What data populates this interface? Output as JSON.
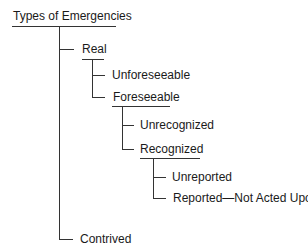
{
  "diagram": {
    "title": "Types of Emergencies",
    "nodes": {
      "real": "Real",
      "unforeseeable": "Unforeseeable",
      "foreseeable": "Foreseeable",
      "unrecognized": "Unrecognized",
      "recognized": "Recognized",
      "unreported": "Unreported",
      "reported_not_acted": "Reported—Not Acted Upon",
      "contrived": "Contrived"
    },
    "tree": {
      "label": "Types of Emergencies",
      "children": [
        {
          "label": "Real",
          "children": [
            {
              "label": "Unforeseeable"
            },
            {
              "label": "Foreseeable",
              "children": [
                {
                  "label": "Unrecognized"
                },
                {
                  "label": "Recognized",
                  "children": [
                    {
                      "label": "Unreported"
                    },
                    {
                      "label": "Reported—Not Acted Upon"
                    }
                  ]
                }
              ]
            }
          ]
        },
        {
          "label": "Contrived"
        }
      ]
    },
    "line_color": "#333333"
  }
}
